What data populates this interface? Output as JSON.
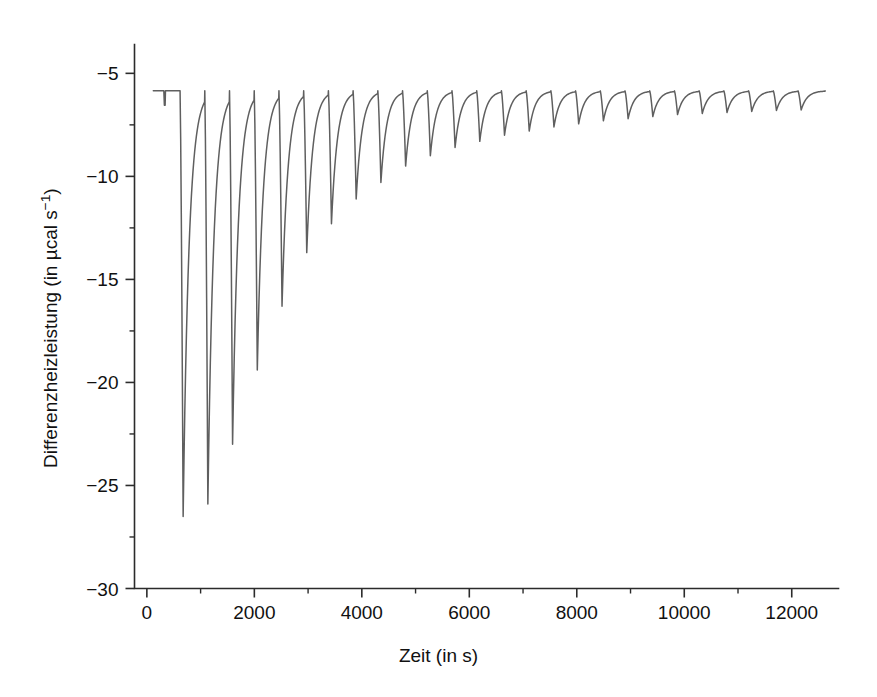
{
  "chart_data": {
    "type": "line",
    "title": "",
    "xlabel": "Zeit (in s)",
    "ylabel_plain": "Differenzheizleistung (in µcal s⁻¹)",
    "ylabel_main": "Differenzheizleistung (in µcal s",
    "ylabel_exponent": "−1",
    "ylabel_tail": ")",
    "xlim": [
      -230,
      12870
    ],
    "ylim": [
      -30,
      -3.6
    ],
    "grid": false,
    "legend": null,
    "series_name": "Differenzheizleistung",
    "trace_color": "#5f5f5f",
    "axis_color": "#2b2b2b",
    "background": "#ffffff",
    "baseline_value": -5.85,
    "x_major_ticks": [
      0,
      2000,
      4000,
      6000,
      8000,
      10000,
      12000
    ],
    "x_major_tick_labels": [
      "0",
      "2000",
      "4000",
      "6000",
      "8000",
      "10000",
      "12000"
    ],
    "x_minor_ticks": [
      1000,
      3000,
      5000,
      7000,
      9000,
      11000
    ],
    "y_major_ticks": [
      -5,
      -10,
      -15,
      -20,
      -25,
      -30
    ],
    "y_major_tick_labels": [
      "−5",
      "−10",
      "−15",
      "−20",
      "−25",
      "−30"
    ],
    "y_minor_ticks": [
      -7.5,
      -12.5,
      -17.5,
      -22.5,
      -27.5
    ],
    "injection_start_time": 640,
    "injection_interval": 460,
    "n_injections": 26,
    "peak_times": [
      640,
      1100,
      1560,
      2020,
      2480,
      2940,
      3400,
      3860,
      4320,
      4780,
      5240,
      5700,
      6160,
      6620,
      7080,
      7540,
      8000,
      8460,
      8920,
      9380,
      9840,
      10300,
      10760,
      11220,
      11680,
      12140
    ],
    "peak_minima": [
      -26.5,
      -25.9,
      -23.0,
      -19.4,
      -16.3,
      -13.7,
      -12.3,
      -11.1,
      -10.3,
      -9.5,
      -9.0,
      -8.6,
      -8.3,
      -8.0,
      -7.8,
      -7.6,
      -7.45,
      -7.3,
      -7.2,
      -7.1,
      -7.0,
      -6.95,
      -6.9,
      -6.85,
      -6.8,
      -6.78
    ],
    "initial_artifact": {
      "time": 330,
      "depth": -6.55
    },
    "trace_start_time": 120,
    "trace_end_time": 12620,
    "peak_fall_duration": 35,
    "peak_recovery_tau": 110
  }
}
